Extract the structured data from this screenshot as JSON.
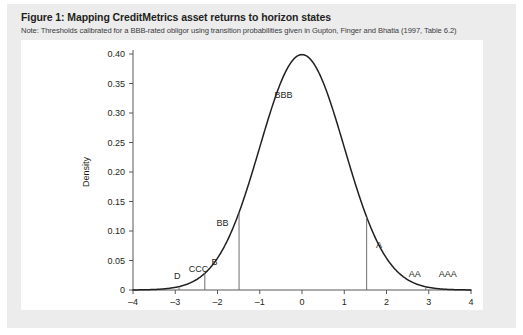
{
  "figure": {
    "title": "Figure 1: Mapping CreditMetrics asset returns to horizon states",
    "note": "Note: Thresholds calibrated for a BBB-rated obligor using transition probabilities given in Gupton, Finger and Bhatia (1997, Table 6.2)"
  },
  "colors": {
    "card_background": "#ececed",
    "plot_background": "#ffffff",
    "curve": "#231f20",
    "axis": "#58585b",
    "threshold": "#6d6e71",
    "title_text": "#231f20",
    "note_text": "#3a3a3c"
  },
  "chart_data": {
    "type": "line",
    "title": "Mapping CreditMetrics asset returns to horizon states",
    "xlabel": "Normalized asset return",
    "ylabel": "Density",
    "xlim": [
      -4,
      4
    ],
    "ylim": [
      0,
      0.4
    ],
    "grid": false,
    "legend": "none",
    "xticks": [
      -4,
      -3,
      -2,
      -1,
      0,
      1,
      2,
      3,
      4
    ],
    "xticklabels": [
      "–4",
      "–3",
      "–2",
      "–1",
      "0",
      "1",
      "2",
      "3",
      "4"
    ],
    "yticks": [
      0,
      0.05,
      0.1,
      0.15,
      0.2,
      0.25,
      0.3,
      0.35,
      0.4
    ],
    "yticklabels": [
      "0",
      "0.05",
      "0.10",
      "0.15",
      "0.20",
      "0.25",
      "0.30",
      "0.35",
      "0.40"
    ],
    "series": [
      {
        "name": "Standard normal density of normalized asset return",
        "distribution": "normal",
        "mean": 0,
        "sd": 1,
        "peak_value": 0.399,
        "x": [
          -4.0,
          -3.5,
          -3.0,
          -2.5,
          -2.0,
          -1.5,
          -1.0,
          -0.5,
          0.0,
          0.5,
          1.0,
          1.5,
          2.0,
          2.5,
          3.0,
          3.5,
          4.0
        ],
        "values": [
          0.0001,
          0.0009,
          0.0044,
          0.0175,
          0.054,
          0.1295,
          0.242,
          0.3521,
          0.3989,
          0.3521,
          0.242,
          0.1295,
          0.054,
          0.0175,
          0.0044,
          0.0009,
          0.0001
        ]
      }
    ],
    "thresholds": [
      {
        "state": "D",
        "label": "D",
        "x": -3.24,
        "line_x": null,
        "label_x": -2.95,
        "label_y": 0.018,
        "has_line": false
      },
      {
        "state": "CCC",
        "label": "CCC",
        "x": -2.91,
        "line_x": -2.91,
        "label_x": -2.45,
        "label_y": 0.03,
        "has_line": true
      },
      {
        "state": "B",
        "label": "B",
        "x": -2.3,
        "line_x": -2.3,
        "label_x": -2.07,
        "label_y": 0.043,
        "has_line": true
      },
      {
        "state": "BB",
        "label": "BB",
        "x": -1.49,
        "line_x": -1.49,
        "label_x": -1.88,
        "label_y": 0.108,
        "has_line": true
      },
      {
        "state": "BBB",
        "label": "BBB",
        "x": 1.53,
        "line_x": null,
        "label_x": -0.44,
        "label_y": 0.325,
        "has_line": false
      },
      {
        "state": "A",
        "label": "A",
        "x": 1.53,
        "line_x": 1.53,
        "label_x": 1.82,
        "label_y": 0.072,
        "has_line": true
      },
      {
        "state": "AA",
        "label": "AA",
        "x": 2.93,
        "line_x": 2.93,
        "label_x": 2.67,
        "label_y": 0.022,
        "has_line": true
      },
      {
        "state": "AAA",
        "label": "AAA",
        "x": 3.43,
        "line_x": null,
        "label_x": 3.45,
        "label_y": 0.022,
        "has_line": false
      }
    ]
  }
}
